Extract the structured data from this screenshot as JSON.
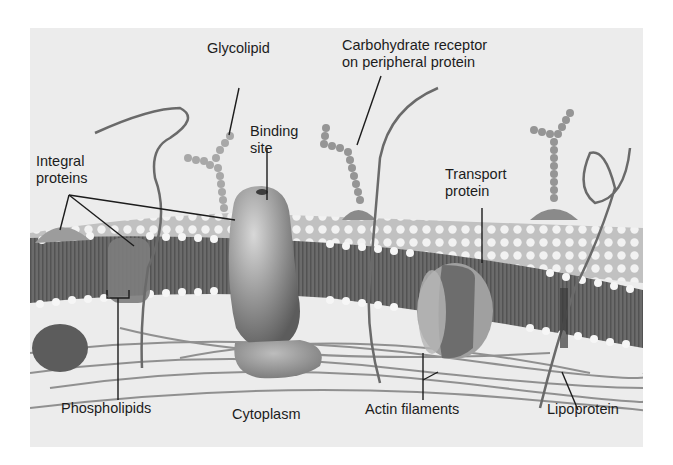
{
  "diagram": {
    "labels": {
      "glycolipid": "Glycolipid",
      "carbohydrate_receptor_line1": "Carbohydrate receptor",
      "carbohydrate_receptor_line2": "on peripheral protein",
      "binding_site_line1": "Binding",
      "binding_site_line2": "site",
      "integral_proteins_line1": "Integral",
      "integral_proteins_line2": "proteins",
      "transport_protein_line1": "Transport",
      "transport_protein_line2": "protein",
      "phospholipids": "Phospholipids",
      "cytoplasm": "Cytoplasm",
      "actin_filaments": "Actin filaments",
      "lipoprotein": "Lipoprotein"
    },
    "colors": {
      "background": "#ececec",
      "bilayer_core": "#6e6e6e",
      "head_groups": "#f4f4f4",
      "protein": "#8a8a8a",
      "transport_center": "#6a6a6a",
      "leader_lines": "#1c1c1c"
    }
  }
}
